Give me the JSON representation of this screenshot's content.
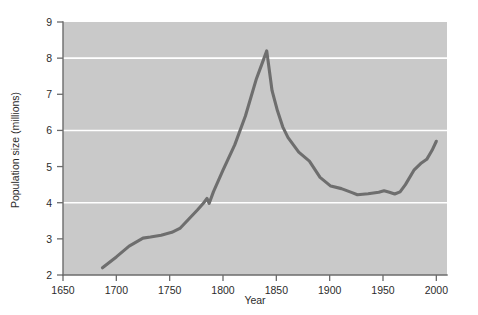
{
  "chart_data": {
    "type": "line",
    "title": "",
    "xlabel": "Year",
    "ylabel": "Population size (millions)",
    "xlim": [
      1650,
      2010
    ],
    "ylim": [
      2,
      9
    ],
    "xticks": [
      1650,
      1700,
      1750,
      1800,
      1850,
      1900,
      1950,
      2000
    ],
    "yticks": [
      2,
      3,
      4,
      5,
      6,
      7,
      8,
      9
    ],
    "xtick_labels": [
      "1650",
      "1700",
      "1750",
      "1800",
      "1850",
      "1900",
      "1950",
      "2000"
    ],
    "ytick_labels": [
      "2",
      "3",
      "4",
      "5",
      "6",
      "7",
      "8",
      "9"
    ],
    "gridlines_y": [
      4,
      6,
      8
    ],
    "grid": "horizontal-white-at-4-6-8",
    "legend": "none",
    "plot_background": "#c9c9c9",
    "line_color": "#6e6e6e",
    "series": [
      {
        "name": "Population size (millions)",
        "x": [
          1687,
          1700,
          1712,
          1725,
          1732,
          1742,
          1752,
          1760,
          1768,
          1776,
          1782,
          1785,
          1787,
          1791,
          1800,
          1811,
          1821,
          1831,
          1836,
          1841,
          1846,
          1851,
          1856,
          1861,
          1871,
          1881,
          1891,
          1901,
          1911,
          1921,
          1926,
          1936,
          1946,
          1951,
          1956,
          1961,
          1966,
          1971,
          1979,
          1986,
          1991,
          1996,
          2000
        ],
        "y": [
          2.2,
          2.5,
          2.8,
          3.02,
          3.05,
          3.1,
          3.18,
          3.3,
          3.55,
          3.8,
          4.0,
          4.12,
          3.98,
          4.3,
          4.9,
          5.6,
          6.4,
          7.4,
          7.8,
          8.2,
          7.1,
          6.55,
          6.1,
          5.8,
          5.4,
          5.15,
          4.7,
          4.46,
          4.39,
          4.28,
          4.22,
          4.25,
          4.29,
          4.33,
          4.29,
          4.24,
          4.3,
          4.5,
          4.9,
          5.1,
          5.2,
          5.45,
          5.7
        ]
      }
    ]
  },
  "axis": {
    "x_title": "Year",
    "y_title": "Population size (millions)"
  }
}
